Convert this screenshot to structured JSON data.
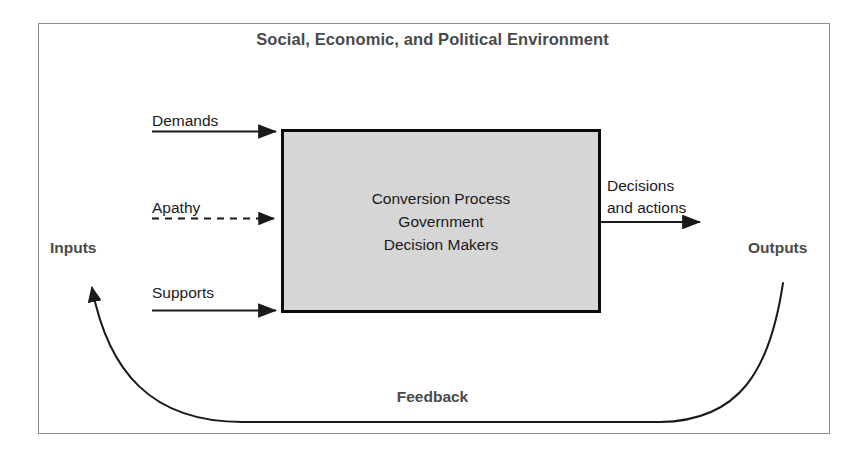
{
  "diagram": {
    "title": "Social, Economic, and Political Environment",
    "environment_frame_label": "Social, Economic, and Political Environment",
    "inputs_label": "Inputs",
    "outputs_label": "Outputs",
    "feedback_label": "Feedback",
    "center_box": {
      "line1": "Conversion Process",
      "line2": "Government",
      "line3": "Decision Makers",
      "fill_color": "#d6d6d6",
      "border_color": "#0a0a0a"
    },
    "input_flows": [
      {
        "label": "Demands",
        "style": "solid"
      },
      {
        "label": "Apathy",
        "style": "dashed"
      },
      {
        "label": "Supports",
        "style": "solid"
      }
    ],
    "output_flow": {
      "line1": "Decisions",
      "line2": "and actions",
      "style": "solid"
    },
    "colors": {
      "frame": "#8d8d8d",
      "heading_text": "#4a4a4a",
      "body_text": "#1a1a1a",
      "line": "#1a1a1a",
      "background": "#ffffff"
    }
  }
}
